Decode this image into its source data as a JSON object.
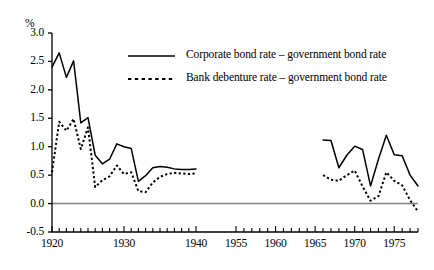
{
  "chart_data": {
    "type": "line",
    "title": "",
    "xlabel": "",
    "ylabel": "%",
    "unit_label": "%",
    "ylim": [
      -0.5,
      3.0
    ],
    "ytick_labels": [
      "3.0",
      "2.5",
      "2.0",
      "1.5",
      "1.0",
      "0.5",
      "0.0",
      "-0.5"
    ],
    "ytick_values": [
      3.0,
      2.5,
      2.0,
      1.5,
      1.0,
      0.5,
      0.0,
      -0.5
    ],
    "xtick_labels": [
      "1920",
      "1930",
      "1940",
      "1955",
      "1960",
      "1965",
      "1970",
      "1975"
    ],
    "xtick_values": [
      1920,
      1930,
      1940,
      1955,
      1960,
      1965,
      1970,
      1975
    ],
    "axis_break": true,
    "axis_break_note": "horizontal axis is compressed between 1940 and 1955; data are missing from 1941 to 1965",
    "grid": false,
    "zero_line": true,
    "zero_line_color": "#808080",
    "legend_position": "upper-center",
    "series": [
      {
        "name": "Corporate bond rate – government bond rate",
        "style": "solid",
        "color": "#000000",
        "segments": [
          {
            "x": [
              1920,
              1921,
              1922,
              1923,
              1924,
              1925,
              1926,
              1927,
              1928,
              1929,
              1930,
              1931,
              1932,
              1933,
              1934,
              1935,
              1936,
              1937,
              1938,
              1939,
              1940
            ],
            "y": [
              2.4,
              2.65,
              2.22,
              2.51,
              1.42,
              1.51,
              0.85,
              0.7,
              0.78,
              1.05,
              1.0,
              0.97,
              0.39,
              0.49,
              0.63,
              0.65,
              0.64,
              0.61,
              0.6,
              0.6,
              0.61
            ]
          },
          {
            "x": [
              1966,
              1967,
              1968,
              1969,
              1970,
              1971,
              1972,
              1973,
              1974,
              1975,
              1976,
              1977,
              1978
            ],
            "y": [
              1.12,
              1.11,
              0.63,
              0.85,
              1.01,
              0.95,
              0.31,
              0.78,
              1.2,
              0.86,
              0.84,
              0.5,
              0.31
            ]
          }
        ]
      },
      {
        "name": "Bank debenture rate – government bond rate",
        "style": "dotted",
        "color": "#000000",
        "segments": [
          {
            "x": [
              1920,
              1921,
              1922,
              1923,
              1924,
              1925,
              1926,
              1927,
              1928,
              1929,
              1930,
              1931,
              1932,
              1933,
              1934,
              1935,
              1936,
              1937,
              1938,
              1939,
              1940
            ],
            "y": [
              0.55,
              1.44,
              1.28,
              1.49,
              0.96,
              1.34,
              0.29,
              0.41,
              0.48,
              0.67,
              0.52,
              0.55,
              0.22,
              0.2,
              0.37,
              0.47,
              0.52,
              0.54,
              0.53,
              0.52,
              0.53
            ]
          },
          {
            "x": [
              1966,
              1967,
              1968,
              1969,
              1970,
              1971,
              1972,
              1973,
              1974,
              1975,
              1976,
              1977,
              1978
            ],
            "y": [
              0.5,
              0.42,
              0.4,
              0.5,
              0.58,
              0.3,
              0.05,
              0.13,
              0.55,
              0.4,
              0.32,
              0.06,
              -0.14
            ]
          }
        ]
      }
    ]
  },
  "legend": {
    "items": [
      {
        "label": "Corporate bond rate – government bond rate",
        "style": "solid"
      },
      {
        "label": "Bank debenture rate – government bond rate",
        "style": "dotted"
      }
    ]
  }
}
